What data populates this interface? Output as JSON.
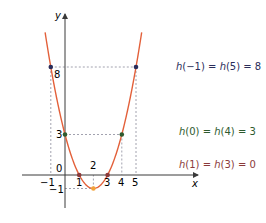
{
  "chart_data": {
    "type": "line",
    "title": "",
    "function": "h(x) = x^2 - 4x + 3",
    "xlabel": "x",
    "ylabel": "y",
    "xlim": [
      -1.4,
      5.4
    ],
    "ylim": [
      -1,
      10.5
    ],
    "grid": false,
    "x_ticks": [
      "-1",
      "1",
      "2",
      "3",
      "4",
      "5"
    ],
    "y_ticks": [
      "8",
      "3",
      "0",
      "-1"
    ],
    "points": [
      {
        "x": -1,
        "y": 8
      },
      {
        "x": 5,
        "y": 8
      },
      {
        "x": 0,
        "y": 3
      },
      {
        "x": 4,
        "y": 3
      },
      {
        "x": 1,
        "y": 0
      },
      {
        "x": 3,
        "y": 0
      },
      {
        "x": 2,
        "y": -1
      }
    ],
    "annotations": [
      {
        "text": "h(−1) = h(5) = 8",
        "color": "#2a2d5a"
      },
      {
        "text": "h(0) = h(4) = 3",
        "color": "#2e5a2e"
      },
      {
        "text": "h(1) = h(3) = 0",
        "color": "#8b3a3a"
      }
    ]
  },
  "colors": {
    "curve": "#e3603a",
    "axis": "#3a3a3a",
    "dash": "#8a8a9a",
    "point_8": "#2a2d5a",
    "point_3": "#2e5a2e",
    "point_0": "#8b3a3a",
    "vertex": "#f2a23a"
  },
  "labels": {
    "y_axis": "y",
    "x_axis": "x",
    "tick_8": "8",
    "tick_3": "3",
    "tick_0": "0",
    "tick_neg1_y": "−1",
    "tick_neg1_x": "−1",
    "tick_1": "1",
    "tick_2": "2",
    "tick_3x": "3",
    "tick_4": "4",
    "tick_5": "5"
  },
  "legend": {
    "l1_a": "h",
    "l1_b": "(−1) = ",
    "l1_c": "h",
    "l1_d": "(5) = 8",
    "l2_a": "h",
    "l2_b": "(0) = ",
    "l2_c": "h",
    "l2_d": "(4) = 3",
    "l3_a": "h",
    "l3_b": "(1) = ",
    "l3_c": "h",
    "l3_d": "(3) = 0"
  }
}
